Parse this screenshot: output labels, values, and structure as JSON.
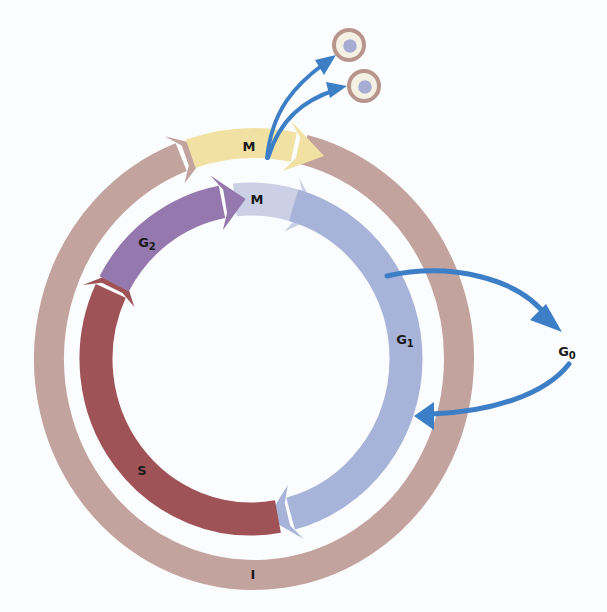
{
  "labels": {
    "mitosis_outer": "M",
    "mitosis_inner": "M",
    "g2": {
      "main": "G",
      "sub": "2"
    },
    "g1": {
      "main": "G",
      "sub": "1"
    },
    "g0": {
      "main": "G",
      "sub": "0"
    },
    "s": "S",
    "interphase": "I"
  },
  "colors": {
    "interphase": "#c2a39e",
    "mitosis_outer": "#f1e2a4",
    "mitosis_inner": "#ccd0e6",
    "g1": "#a7b3d9",
    "s": "#a05357",
    "g2": "#9578ae",
    "blue_arrow": "#3d7fc6",
    "cell_membrane": "#b8958c",
    "cell_cytoplasm": "#f5f0e4",
    "cell_nucleus": "#a7acd2",
    "background": "#fbfcfd"
  },
  "geometry": {
    "outer_ring": {
      "cx": 254,
      "cy": 359,
      "rx": 205,
      "ry": 216,
      "width": 30
    },
    "inner_ring": {
      "cx": 251,
      "cy": 359,
      "rx": 155,
      "ry": 160,
      "width": 33
    },
    "segments": [
      {
        "id": "interphase",
        "ring": "outer_ring",
        "start": -76,
        "end": 258,
        "color": "interphase"
      },
      {
        "id": "mitosis_inner",
        "ring": "inner_ring",
        "start": -96,
        "end": -64,
        "color": "mitosis_inner"
      },
      {
        "id": "g1",
        "ring": "inner_ring",
        "start": -74,
        "end": 84,
        "color": "g1"
      },
      {
        "id": "s",
        "ring": "inner_ring",
        "start": 80,
        "end": 214,
        "color": "s"
      },
      {
        "id": "g2",
        "ring": "inner_ring",
        "start": 208,
        "end": 268,
        "color": "g2"
      },
      {
        "id": "mitosis_outer",
        "ring": "outer_ring",
        "start": 252,
        "end": 290,
        "color": "mitosis_outer"
      }
    ]
  },
  "label_positions": {
    "mitosis_outer": [
      249,
      146
    ],
    "mitosis_inner": [
      257,
      199
    ],
    "g2": [
      147,
      243
    ],
    "g1": [
      405,
      340
    ],
    "g0": [
      567,
      352
    ],
    "s": [
      142,
      470
    ],
    "interphase": [
      253,
      574
    ]
  },
  "daughter_cells": [
    {
      "cx": 349,
      "cy": 45,
      "r": 15
    },
    {
      "cx": 364,
      "cy": 86,
      "r": 15
    }
  ]
}
